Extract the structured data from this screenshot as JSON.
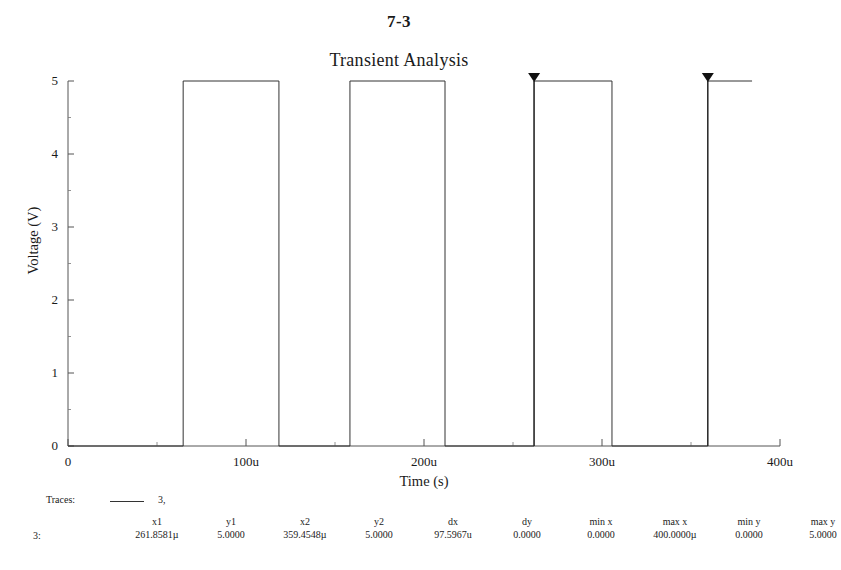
{
  "page": {
    "number": "7-3"
  },
  "chart_data": {
    "type": "line",
    "title": "Transient Analysis",
    "xlabel": "Time (s)",
    "ylabel": "Voltage (V)",
    "xlim": [
      0,
      0.0004
    ],
    "ylim": [
      0,
      5
    ],
    "xtick_labels": [
      "0",
      "100u",
      "200u",
      "300u",
      "400u"
    ],
    "xtick_values": [
      0,
      0.0001,
      0.0002,
      0.0003,
      0.0004
    ],
    "ytick_labels": [
      "0",
      "1",
      "2",
      "3",
      "4",
      "5"
    ],
    "ytick_values": [
      0,
      1,
      2,
      3,
      4,
      5
    ],
    "grid": false,
    "legend_position": "below-plot",
    "series": [
      {
        "name": "3",
        "color": "#333333",
        "description": "Square-wave pulse train, 0 V to 5 V",
        "x": [
          0,
          6.47e-05,
          6.47e-05,
          0.0001185,
          0.0001185,
          0.0001584,
          0.0001584,
          0.0002118,
          0.0002118,
          0.0002618,
          0.0002618,
          0.0003056,
          0.0003056,
          0.0003594,
          0.0003594,
          0.0003843
        ],
        "y": [
          0,
          0,
          5,
          5,
          0,
          0,
          5,
          5,
          0,
          0,
          5,
          5,
          0,
          0,
          5,
          5
        ]
      }
    ],
    "cursors": [
      {
        "name": "cursor-1",
        "x": 0.0002618581,
        "y": 5.0,
        "marker": "down-triangle"
      },
      {
        "name": "cursor-2",
        "x": 0.0003594548,
        "y": 5.0,
        "marker": "down-triangle"
      }
    ]
  },
  "traces": {
    "label": "Traces:",
    "entries": [
      {
        "name": "3,",
        "color": "#333333"
      }
    ]
  },
  "readout": {
    "row_label": "3:",
    "columns": [
      {
        "header": "x1",
        "value": "261.8581µ"
      },
      {
        "header": "y1",
        "value": "5.0000"
      },
      {
        "header": "x2",
        "value": "359.4548µ"
      },
      {
        "header": "y2",
        "value": "5.0000"
      },
      {
        "header": "dx",
        "value": "97.5967u"
      },
      {
        "header": "dy",
        "value": "0.0000"
      },
      {
        "header": "min x",
        "value": "0.0000"
      },
      {
        "header": "max x",
        "value": "400.0000µ"
      },
      {
        "header": "min y",
        "value": "0.0000"
      },
      {
        "header": "max y",
        "value": "5.0000"
      }
    ]
  }
}
